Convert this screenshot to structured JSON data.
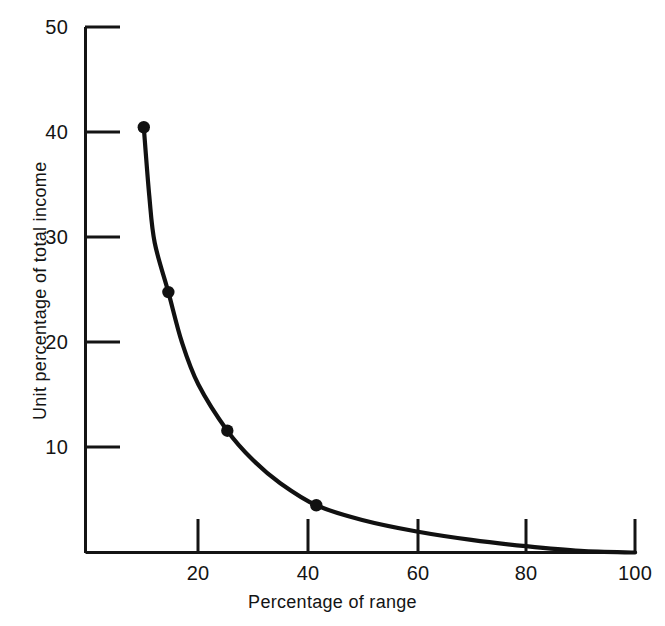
{
  "chart_data": {
    "type": "line",
    "title": "",
    "subtitle": "",
    "xlabel": "Percentage of range",
    "ylabel": "Unit percentage of total income",
    "xlim": [
      0,
      100
    ],
    "ylim": [
      0,
      50
    ],
    "grid": false,
    "legend": null,
    "xticks": [
      20,
      40,
      60,
      80,
      100
    ],
    "xtick_labels": [
      "20",
      "40",
      "60",
      "80",
      "100"
    ],
    "yticks": [
      10,
      20,
      30,
      40,
      50
    ],
    "ytick_labels": [
      "10",
      "20",
      "30",
      "40",
      "50"
    ],
    "series": [
      {
        "name": "Unit percentage of total income",
        "marker": "filled-circle",
        "color": "#111111",
        "x": [
          10,
          14.5,
          25.3,
          41.6
        ],
        "values": [
          40.5,
          24.8,
          11.6,
          4.5
        ]
      }
    ],
    "curve_points": [
      {
        "x": 10.0,
        "y": 40.5
      },
      {
        "x": 11.0,
        "y": 34.0
      },
      {
        "x": 12.0,
        "y": 29.5
      },
      {
        "x": 14.5,
        "y": 24.8
      },
      {
        "x": 17.0,
        "y": 20.0
      },
      {
        "x": 20.0,
        "y": 16.0
      },
      {
        "x": 25.3,
        "y": 11.6
      },
      {
        "x": 30.0,
        "y": 8.8
      },
      {
        "x": 35.0,
        "y": 6.6
      },
      {
        "x": 41.6,
        "y": 4.5
      },
      {
        "x": 50.0,
        "y": 3.1
      },
      {
        "x": 60.0,
        "y": 2.0
      },
      {
        "x": 70.0,
        "y": 1.2
      },
      {
        "x": 80.0,
        "y": 0.6
      },
      {
        "x": 90.0,
        "y": 0.15
      },
      {
        "x": 100.0,
        "y": 0.0
      }
    ],
    "axis_color": "#141414",
    "curve_color": "#111111"
  },
  "axes": {
    "y_title": "Unit percentage of total income",
    "x_title": "Percentage of range",
    "y_labels": [
      "50",
      "40",
      "30",
      "20",
      "10"
    ],
    "x_labels": [
      "20",
      "40",
      "60",
      "80",
      "100"
    ]
  }
}
